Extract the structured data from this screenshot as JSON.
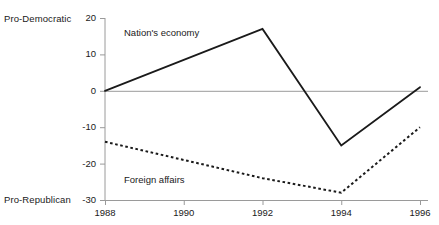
{
  "axis_labels": {
    "top_left": "Pro-Democratic",
    "bottom_left": "Pro-Republican"
  },
  "colors": {
    "axis": "#9a9a9a",
    "zero_line": "#9a9a9a",
    "series_line": "#1a1a1a",
    "text": "#1a1a1a",
    "background": "#ffffff"
  },
  "chart_data": {
    "type": "line",
    "title": "",
    "subtitle": "",
    "xlabel": "",
    "ylabel": "",
    "x": [
      1988,
      1990,
      1992,
      1994,
      1996
    ],
    "categories": [
      "1988",
      "1990",
      "1992",
      "1994",
      "1996"
    ],
    "xlim": [
      1988,
      1996
    ],
    "ylim": [
      -30,
      20
    ],
    "yticks": [
      20,
      10,
      0,
      -10,
      -20,
      -30
    ],
    "ytick_labels": [
      "20",
      "10",
      "0",
      "-10",
      "-20",
      "-30"
    ],
    "xticks": [
      1988,
      1990,
      1992,
      1994,
      1996
    ],
    "xtick_labels": [
      "1988",
      "1990",
      "1992",
      "1994",
      "1996"
    ],
    "grid": false,
    "zero_reference_line": 0,
    "legend": "inline-annotations",
    "legend_position": "inline",
    "series": [
      {
        "name": "Nation's economy",
        "style": "solid",
        "x": [
          1988,
          1992,
          1994,
          1996
        ],
        "values": [
          0,
          17,
          -15,
          1
        ]
      },
      {
        "name": "Foreign affairs",
        "style": "dotted",
        "x": [
          1988,
          1992,
          1994,
          1996
        ],
        "values": [
          -14,
          -24,
          -28,
          -10
        ]
      }
    ],
    "annotations": [
      {
        "text": "Nation's economy",
        "x": 1989.6,
        "y": 14
      },
      {
        "text": "Foreign affairs",
        "x": 1989.6,
        "y": -25
      }
    ]
  }
}
